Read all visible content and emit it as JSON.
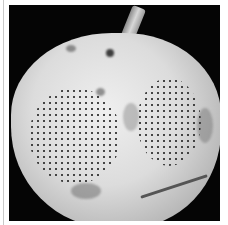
{
  "image": {
    "description": "Black-and-white photograph of an apple with two circular patches of dark dot patterns on its skin, stem at top, against a black background with a white border",
    "subject": "apple",
    "colors": {
      "background": "#050505",
      "border": "#ffffff",
      "apple_skin": "#dcdcdc",
      "dots": "#2a2a2a"
    }
  }
}
